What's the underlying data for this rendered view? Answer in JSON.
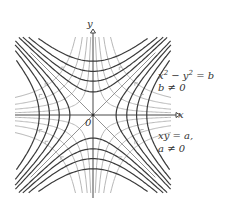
{
  "figure": {
    "axes": {
      "x_label": "x",
      "y_label": "y",
      "origin_label": "0"
    },
    "families": [
      {
        "name": "hyperbolas-x2-minus-y2",
        "equation": "x² − y² = b",
        "condition": "b ≠ 0",
        "color": "#3a3a3a",
        "b_values": [
          0.35,
          0.75,
          1.25,
          1.9
        ]
      },
      {
        "name": "hyperbolas-xy",
        "equation": "xy = a,",
        "condition": "a ≠ 0",
        "color": "#b8b8b8",
        "a_values": [
          0.12,
          0.3,
          0.55,
          0.9
        ]
      }
    ],
    "asymptotes": [
      "y = x",
      "y = −x"
    ]
  }
}
